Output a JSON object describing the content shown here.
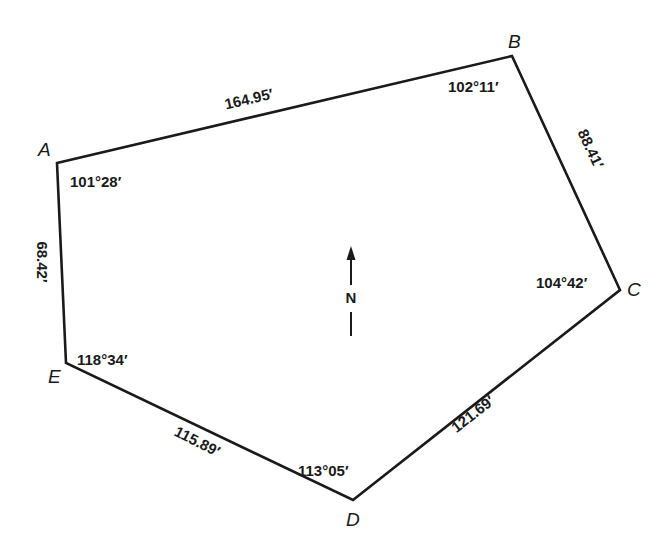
{
  "diagram": {
    "type": "traverse-polygon",
    "line_color": "#1a1a1a",
    "background": "#ffffff",
    "vertices": [
      {
        "id": "A",
        "label": "A",
        "x": 57,
        "y": 163,
        "angle": "101°28′",
        "label_x": 38,
        "label_y": 156,
        "angle_x": 70,
        "angle_y": 187
      },
      {
        "id": "B",
        "label": "B",
        "x": 512,
        "y": 56,
        "angle": "102°11′",
        "label_x": 508,
        "label_y": 48,
        "angle_x": 448,
        "angle_y": 92
      },
      {
        "id": "C",
        "label": "C",
        "x": 620,
        "y": 290,
        "angle": "104°42′",
        "label_x": 627,
        "label_y": 296,
        "angle_x": 536,
        "angle_y": 288
      },
      {
        "id": "D",
        "label": "D",
        "x": 353,
        "y": 500,
        "angle": "113°05′",
        "label_x": 346,
        "label_y": 526,
        "angle_x": 298,
        "angle_y": 476
      },
      {
        "id": "E",
        "label": "E",
        "x": 66,
        "y": 363,
        "angle": "118°34′",
        "label_x": 48,
        "label_y": 383,
        "angle_x": 77,
        "angle_y": 365
      }
    ],
    "edges": [
      {
        "from": "A",
        "to": "B",
        "length": "164.95′",
        "x": 250,
        "y": 104,
        "rotate": -13
      },
      {
        "from": "B",
        "to": "C",
        "length": "88.41′",
        "x": 586,
        "y": 151,
        "rotate": 65
      },
      {
        "from": "C",
        "to": "D",
        "length": "121.69′",
        "x": 476,
        "y": 418,
        "rotate": -38
      },
      {
        "from": "D",
        "to": "E",
        "length": "115.89′",
        "x": 195,
        "y": 446,
        "rotate": 27
      },
      {
        "from": "E",
        "to": "A",
        "length": "68.42′",
        "x": 37,
        "y": 262,
        "rotate": 90
      }
    ],
    "north_arrow": {
      "label": "N",
      "x": 351,
      "arrow_tip_y": 246,
      "arrow_base_y": 285,
      "label_y": 303,
      "tail_top_y": 312,
      "tail_bottom_y": 336
    }
  }
}
